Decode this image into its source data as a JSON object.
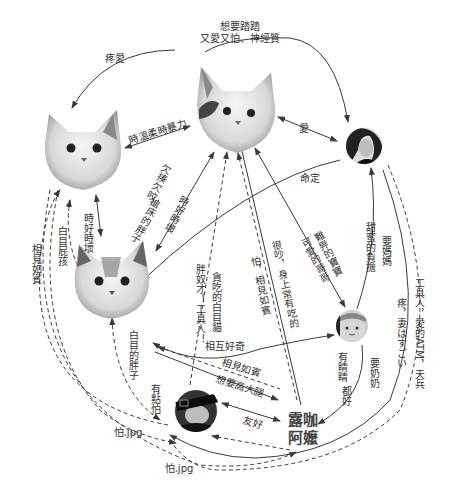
{
  "diagram": {
    "type": "relationship-map",
    "nodes": [
      {
        "id": "cat_top",
        "kind": "cat-photo",
        "label": ""
      },
      {
        "id": "cat_left",
        "kind": "cat-photo",
        "label": ""
      },
      {
        "id": "cat_mid",
        "kind": "cat-photo",
        "label": ""
      },
      {
        "id": "woman",
        "kind": "person-photo",
        "label": ""
      },
      {
        "id": "baby",
        "kind": "person-photo",
        "label": ""
      },
      {
        "id": "man",
        "kind": "person-photo",
        "label": ""
      },
      {
        "id": "lukaamei",
        "kind": "text",
        "label_line1": "露咖",
        "label_line2": "阿嬤"
      }
    ],
    "edges": {
      "top_to_woman": "想要踏踏",
      "top_to_woman_2": "又愛又怕、神經質",
      "top_to_left": "疼愛",
      "left_top_mutual": "時溫柔時暴力",
      "top_woman_mutual": "愛",
      "woman_to_mid": "命定",
      "left_mid_mutual": "時好時壞",
      "top_mid_a": "欠揍欠咬、",
      "top_mid_b": "搶床的胖子",
      "top_mid_c": "時好時壞",
      "mid_to_left_a": "白目屁孩",
      "mid_to_left_b": "相見如賓",
      "man_to_top": "胖奴才！工具人！",
      "man_to_top_2": "貪吃的白目貓",
      "amei_to_top": "怕，相見如賓",
      "amei_to_top_2": "很吵，身上常有吃的",
      "top_to_baby_a": "難畀的寶寶",
      "top_to_baby_b": "可愛的哥哥",
      "woman_baby_a": "甜蜜的負擔",
      "woman_baby_b": "要媽媽",
      "man_to_woman_a": "工具人，愛的ATM，天兵",
      "woman_to_man_b": "疼，妻はすごい",
      "mid_baby_mutual": "相互好奇",
      "mid_man": "白目的胖子",
      "man_to_mid": "有點怕",
      "mid_man_dash": "相見如賓",
      "man_to_amei": "想要高大腿",
      "man_amei_mutual": "友好",
      "baby_to_amei_a": "有睛睛",
      "baby_to_amei_b": "都好",
      "baby_to_amei_c": "要奶奶",
      "left_to_man": "怕.jpg",
      "left_to_man_2": "怕.jpg"
    }
  }
}
